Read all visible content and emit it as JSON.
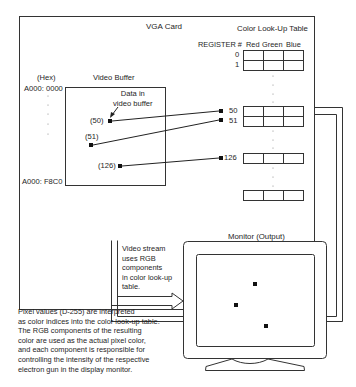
{
  "vga_card": {
    "title": "VGA Card"
  },
  "video_buffer": {
    "title": "Video Buffer",
    "address_header": "(Hex)",
    "address_start": "A000: 0000",
    "address_end": "A000: F8C0",
    "annotation": "Data in\nvideo buffer",
    "pixels": [
      {
        "label": "(50)",
        "register": "50"
      },
      {
        "label": "(51)",
        "register": "51"
      },
      {
        "label": "(126)",
        "register": "126"
      }
    ]
  },
  "color_lookup_table": {
    "title": "Color Look-Up Table",
    "register_header": "REGISTER #",
    "columns": [
      "Red",
      "Green",
      "Blue"
    ],
    "rows": [
      {
        "register": "0"
      },
      {
        "register": "1"
      },
      {
        "register": "50"
      },
      {
        "register": "51"
      },
      {
        "register": "126"
      },
      {
        "register": ""
      }
    ]
  },
  "video_stream": {
    "caption": "Video stream\nuses RGB\ncomponents\nin color look-up\ntable."
  },
  "monitor": {
    "title": "Monitor (Output)"
  },
  "description": "Pixel values (D-255) are interpreted\nas color indices into the color look-up table.\nThe RGB components of the resulting\ncolor are used as the actual pixel color,\nand each component is responsible for\ncontrolling the intensity of the respective\nelectron gun in the display monitor.",
  "colors": {
    "line": "#333333",
    "background": "#ffffff"
  }
}
